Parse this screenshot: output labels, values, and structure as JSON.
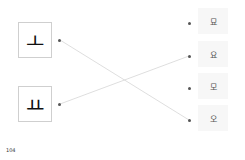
{
  "left_items": [
    {
      "label": "ㅗ"
    },
    {
      "label": "ㅛ"
    }
  ],
  "right_items": [
    {
      "label": "묘"
    },
    {
      "label": "요"
    },
    {
      "label": "모"
    },
    {
      "label": "오"
    }
  ],
  "connections": [
    {
      "from": "ㅗ",
      "to": "오"
    },
    {
      "from": "ㅛ",
      "to": "요"
    }
  ],
  "footer": {
    "page_number": "104"
  },
  "colors": {
    "line": "#d6d6d6",
    "dot": "#555555",
    "box_border": "#cfcfcf"
  }
}
